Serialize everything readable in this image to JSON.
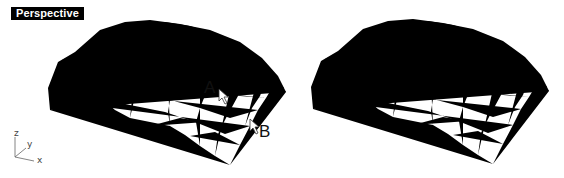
{
  "viewport": {
    "title": "Perspective"
  },
  "callouts": {
    "point_a": "A",
    "point_b": "B"
  },
  "axes": {
    "z": "z",
    "y": "y",
    "x": "x"
  },
  "panels": [
    {
      "name": "before",
      "shows_callouts": true
    },
    {
      "name": "after",
      "shows_callouts": false
    }
  ],
  "colors": {
    "background": "#ffffff",
    "wire": "#1a1a1a",
    "label_bg": "#000000",
    "label_fg": "#ffffff"
  }
}
